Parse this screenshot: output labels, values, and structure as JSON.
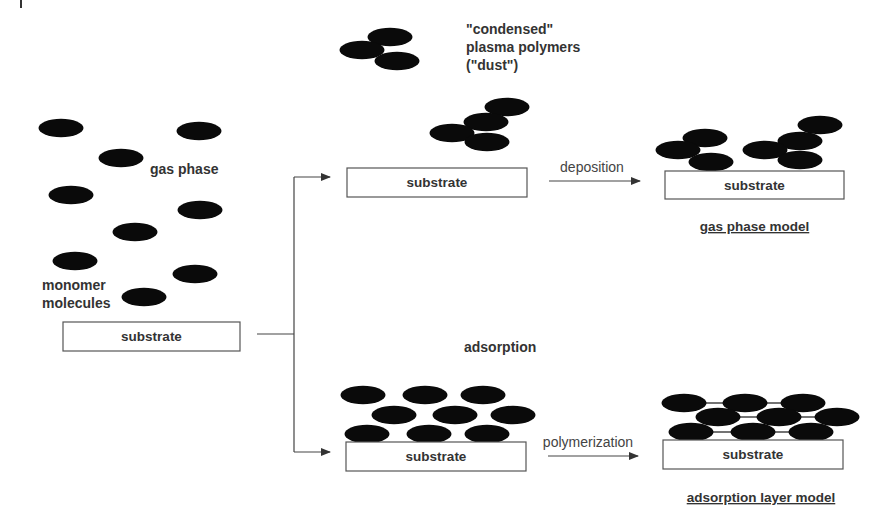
{
  "labels": {
    "gas_phase": "gas phase",
    "monomer_line1": "monomer",
    "monomer_line2": "molecules",
    "condensed_line1": "\"condensed\"",
    "condensed_line2": "plasma polymers",
    "condensed_line3": "(\"dust\")",
    "adsorption": "adsorption",
    "deposition": "deposition",
    "polymerization": "polymerization",
    "gas_phase_model": "gas phase model",
    "adsorption_layer_model": "adsorption layer model"
  },
  "substrates": {
    "initial": "substrate",
    "gas_phase_intermediate": "substrate",
    "gas_phase_final": "substrate",
    "adsorption_intermediate": "substrate",
    "adsorption_final": "substrate"
  },
  "colors": {
    "molecule": "#0a0a0a",
    "text": "#333333",
    "box_stroke": "#555555",
    "background": "#ffffff"
  },
  "molecules": {
    "gas_phase": [
      [
        61,
        128
      ],
      [
        199,
        131
      ],
      [
        121,
        158
      ],
      [
        71,
        195
      ],
      [
        200,
        210
      ],
      [
        135,
        232
      ],
      [
        75,
        261
      ],
      [
        195,
        274
      ],
      [
        144,
        297
      ]
    ],
    "dust_cluster": [
      [
        390,
        37
      ],
      [
        362,
        50
      ],
      [
        397,
        61
      ]
    ],
    "above_substrate_cluster": [
      [
        507,
        107
      ],
      [
        486,
        122
      ],
      [
        452,
        133
      ],
      [
        487,
        142
      ]
    ],
    "gas_phase_model": [
      [
        705,
        138
      ],
      [
        678,
        150
      ],
      [
        711,
        162
      ],
      [
        820,
        125
      ],
      [
        800,
        141
      ],
      [
        765,
        150
      ],
      [
        800,
        160
      ]
    ],
    "adsorbed_layer": [
      [
        363,
        395
      ],
      [
        425,
        395
      ],
      [
        483,
        395
      ],
      [
        394,
        415
      ],
      [
        455,
        415
      ],
      [
        513,
        415
      ],
      [
        367,
        434
      ],
      [
        429,
        434
      ],
      [
        487,
        434
      ]
    ],
    "polymerized_layer": [
      [
        684,
        403
      ],
      [
        745,
        403
      ],
      [
        803,
        403
      ],
      [
        718,
        417
      ],
      [
        779,
        417
      ],
      [
        837,
        417
      ],
      [
        691,
        432
      ],
      [
        753,
        432
      ],
      [
        811,
        432
      ]
    ]
  }
}
